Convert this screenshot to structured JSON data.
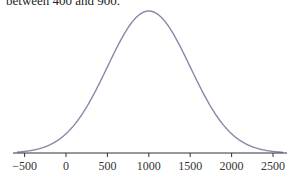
{
  "caption": "between 400 and 900.",
  "chart_data": {
    "type": "line",
    "title": "",
    "xlabel": "",
    "ylabel": "",
    "distribution": "normal",
    "mean": 1000,
    "sd": 500,
    "xlim": [
      -620,
      2650
    ],
    "x_ticks": [
      -500,
      0,
      500,
      1000,
      1500,
      2000,
      2500
    ],
    "x_tick_labels": [
      "−500",
      "0",
      "500",
      "1000",
      "1500",
      "2000",
      "2500"
    ],
    "y_axis_shown": false,
    "grid": false,
    "legend": null,
    "curve_color": "#8a86a8",
    "axis_color": "#333333"
  }
}
